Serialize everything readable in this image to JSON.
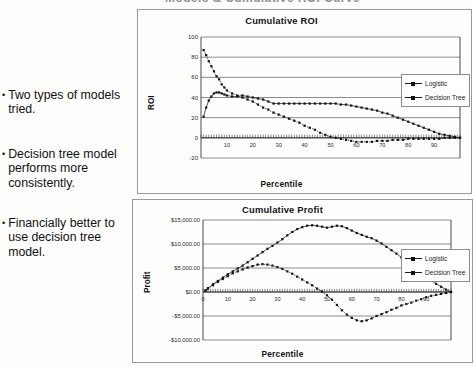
{
  "slide": {
    "clipped_title": "Models & Cumulative ROI Curve",
    "bullets": [
      {
        "marker": "•",
        "text": "Two types of models tried."
      },
      {
        "marker": "•",
        "text": "Decision tree model performs more consistently."
      },
      {
        "marker": "•",
        "text": "Financially better to use decision tree model."
      }
    ]
  },
  "legend_labels": {
    "logistic": "Logistic",
    "decision_tree": "Decision Tree"
  },
  "chart_data": [
    {
      "type": "line",
      "id": "cumulative-roi",
      "title": "Cumulative ROI",
      "xlabel": "Percentile",
      "ylabel": "ROI",
      "xlim": [
        0,
        100
      ],
      "ylim": [
        -20,
        100
      ],
      "yticks": [
        -20,
        0,
        20,
        40,
        60,
        80,
        100
      ],
      "ytick_labels": [
        "-20",
        "0",
        "20",
        "40",
        "60",
        "80",
        "100"
      ],
      "xticks": [
        0,
        10,
        20,
        30,
        40,
        50,
        60,
        70,
        80,
        90
      ],
      "xtick_labels": [
        "0",
        "10",
        "20",
        "30",
        "40",
        "50",
        "60",
        "70",
        "80",
        "90"
      ],
      "grid": "horizontal",
      "legend_position": "right-outside",
      "x": [
        1,
        2,
        3,
        4,
        5,
        6,
        7,
        8,
        9,
        10,
        12,
        14,
        16,
        18,
        20,
        22,
        24,
        26,
        28,
        30,
        32,
        34,
        36,
        38,
        40,
        42,
        44,
        46,
        48,
        50,
        52,
        54,
        56,
        58,
        60,
        62,
        64,
        66,
        68,
        70,
        72,
        74,
        76,
        78,
        80,
        82,
        84,
        86,
        88,
        90,
        92,
        94,
        96,
        98,
        100
      ],
      "series": [
        {
          "name": "Logistic",
          "values": [
            87,
            82,
            76,
            71,
            66,
            61,
            58,
            53,
            50,
            47,
            44,
            42,
            40,
            38,
            36,
            33,
            30,
            28,
            25,
            23,
            21,
            19,
            17,
            15,
            12,
            10,
            8,
            5,
            3,
            1,
            0,
            -1,
            -2,
            -3,
            -4,
            -4,
            -4,
            -4,
            -3,
            -3,
            -3,
            -2,
            -2,
            -2,
            -1,
            -1,
            -1,
            -1,
            -1,
            -1,
            -1,
            0,
            0,
            0,
            0
          ]
        },
        {
          "name": "Decision Tree",
          "values": [
            21,
            30,
            37,
            41,
            44,
            45,
            45,
            44,
            43,
            42,
            41,
            41,
            42,
            41,
            40,
            39,
            38,
            36,
            34,
            34,
            34,
            34,
            34,
            34,
            34,
            34,
            34,
            34,
            34,
            34,
            34,
            33,
            33,
            32,
            31,
            30,
            29,
            28,
            27,
            25,
            24,
            22,
            20,
            18,
            16,
            14,
            12,
            10,
            8,
            6,
            4,
            3,
            2,
            1,
            0
          ]
        }
      ]
    },
    {
      "type": "line",
      "id": "cumulative-profit",
      "title": "Cumulative Profit",
      "xlabel": "Percentile",
      "ylabel": "Profit",
      "xlim": [
        0,
        100
      ],
      "ylim": [
        -10000,
        15000
      ],
      "yticks": [
        -10000,
        -5000,
        0,
        5000,
        10000,
        15000
      ],
      "ytick_labels": [
        "-$10,000.00",
        "-$5,000.00",
        "$0.00",
        "$5,000.00",
        "$10,000.00",
        "$15,000.00"
      ],
      "xticks": [
        0,
        10,
        20,
        30,
        40,
        50,
        60,
        70,
        80,
        90
      ],
      "xtick_labels": [
        "0",
        "10",
        "20",
        "30",
        "40",
        "50",
        "60",
        "70",
        "80",
        "90"
      ],
      "grid": "horizontal",
      "legend_position": "right-outside",
      "x": [
        1,
        2,
        4,
        6,
        8,
        10,
        12,
        14,
        16,
        18,
        20,
        22,
        24,
        26,
        28,
        30,
        32,
        34,
        36,
        38,
        40,
        42,
        44,
        46,
        48,
        50,
        52,
        54,
        56,
        58,
        60,
        62,
        64,
        66,
        68,
        70,
        72,
        74,
        76,
        78,
        80,
        82,
        84,
        86,
        88,
        90,
        92,
        94,
        96,
        98,
        100
      ],
      "series": [
        {
          "name": "Logistic",
          "values": [
            300,
            700,
            1400,
            2100,
            2700,
            3300,
            3900,
            4300,
            4700,
            5100,
            5400,
            5700,
            5800,
            5700,
            5500,
            5200,
            4800,
            4300,
            3800,
            3200,
            2600,
            2000,
            1400,
            700,
            100,
            -700,
            -1600,
            -2700,
            -3800,
            -4700,
            -5400,
            -5900,
            -6100,
            -5900,
            -5500,
            -5000,
            -4600,
            -4200,
            -3700,
            -3300,
            -2800,
            -2500,
            -2200,
            -1800,
            -1500,
            -1100,
            -800,
            -600,
            -400,
            -200,
            0
          ]
        },
        {
          "name": "Decision Tree",
          "values": [
            300,
            800,
            1600,
            2300,
            3000,
            3700,
            4300,
            4900,
            5500,
            6200,
            6900,
            7600,
            8300,
            9000,
            9600,
            10300,
            11000,
            11800,
            12500,
            13100,
            13500,
            13800,
            13900,
            13800,
            13600,
            13400,
            13600,
            13800,
            13700,
            13300,
            12800,
            12300,
            11900,
            11500,
            11200,
            10700,
            10100,
            9400,
            8700,
            8000,
            7200,
            6400,
            5600,
            4800,
            4000,
            3200,
            2400,
            1700,
            1100,
            500,
            0
          ]
        }
      ]
    }
  ]
}
